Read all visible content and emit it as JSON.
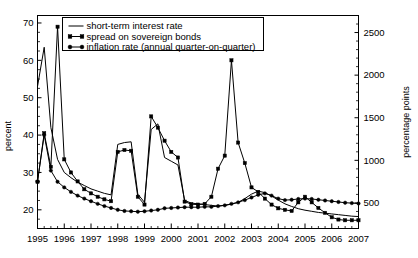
{
  "chart_data": {
    "type": "line",
    "title": "",
    "xlabel": "",
    "ylabel": "percent",
    "y2label": "percentage points",
    "xlim": [
      1995.0,
      2007.0
    ],
    "ylim": [
      15,
      72
    ],
    "y2lim": [
      200,
      2700
    ],
    "grid": false,
    "legend_position": "top-center",
    "xticks": [
      "1995",
      "1996",
      "1997",
      "1998",
      "1999",
      "2000",
      "2001",
      "2002",
      "2003",
      "2004",
      "2005",
      "2006",
      "2007"
    ],
    "yticks": [
      "20",
      "30",
      "40",
      "50",
      "60",
      "70"
    ],
    "y2ticks": [
      "500",
      "1000",
      "1500",
      "2000",
      "2500"
    ],
    "minor_tick_interval_years": 0.25,
    "x": [
      1995.0,
      1995.25,
      1995.5,
      1995.75,
      1996.0,
      1996.25,
      1996.5,
      1996.75,
      1997.0,
      1997.25,
      1997.5,
      1997.75,
      1998.0,
      1998.25,
      1998.5,
      1998.75,
      1999.0,
      1999.25,
      1999.5,
      1999.75,
      2000.0,
      2000.25,
      2000.5,
      2000.75,
      2001.0,
      2001.25,
      2001.5,
      2001.75,
      2002.0,
      2002.25,
      2002.5,
      2002.75,
      2003.0,
      2003.25,
      2003.5,
      2003.75,
      2004.0,
      2004.25,
      2004.5,
      2004.75,
      2005.0,
      2005.25,
      2005.5,
      2005.75,
      2006.0,
      2006.25,
      2006.5,
      2006.75,
      2007.0
    ],
    "series": [
      {
        "name": "short-term interest rate",
        "marker": "none",
        "axis": "left",
        "values": [
          53.0,
          63.5,
          42.0,
          33.5,
          30.0,
          28.6,
          27.4,
          26.5,
          25.6,
          25.0,
          24.4,
          24.0,
          37.5,
          38.0,
          38.2,
          24.2,
          22.0,
          41.5,
          43.0,
          34.0,
          33.0,
          32.0,
          22.5,
          21.8,
          21.6,
          21.4,
          21.2,
          21.0,
          21.2,
          21.5,
          22.0,
          23.0,
          24.2,
          25.0,
          24.6,
          23.7,
          22.6,
          21.6,
          20.9,
          20.3,
          19.9,
          19.6,
          19.3,
          19.1,
          18.9,
          18.7,
          18.5,
          18.3,
          18.2
        ]
      },
      {
        "name": "spread on sovereign bonds",
        "marker": "square",
        "axis": "right",
        "values": [
          27.5,
          40.5,
          31.5,
          69.0,
          33.5,
          30.0,
          27.6,
          25.5,
          24.4,
          23.5,
          22.8,
          22.3,
          35.5,
          36.0,
          35.8,
          23.5,
          21.4,
          45.0,
          42.0,
          38.5,
          35.5,
          34.0,
          22.2,
          21.5,
          21.4,
          21.6,
          23.5,
          31.0,
          34.5,
          60.0,
          38.0,
          32.5,
          26.0,
          24.8,
          23.0,
          21.4,
          20.4,
          20.0,
          19.7,
          22.0,
          23.5,
          22.0,
          20.5,
          19.2,
          18.0,
          17.4,
          17.2,
          17.2,
          17.2
        ]
      },
      {
        "name": "inflation rate (annual quarter-on-quarter)",
        "marker": "circle",
        "axis": "left",
        "values": [
          27.6,
          40.0,
          30.5,
          27.5,
          26.0,
          24.8,
          23.8,
          23.0,
          22.3,
          21.6,
          21.0,
          20.5,
          20.0,
          19.7,
          19.6,
          19.5,
          19.6,
          19.8,
          20.0,
          20.4,
          20.5,
          20.6,
          20.7,
          20.7,
          20.7,
          20.8,
          20.8,
          21.0,
          21.2,
          21.6,
          22.0,
          22.6,
          23.3,
          24.0,
          24.4,
          23.8,
          23.0,
          22.6,
          22.7,
          22.9,
          23.0,
          22.9,
          22.7,
          22.5,
          22.3,
          22.1,
          21.9,
          21.8,
          21.7
        ]
      }
    ]
  },
  "legend": {
    "items": [
      {
        "label": "short-term interest rate",
        "marker": "none"
      },
      {
        "label": "spread on sovereign bonds",
        "marker": "square"
      },
      {
        "label": "inflation rate (annual quarter-on-quarter)",
        "marker": "circle"
      }
    ]
  }
}
